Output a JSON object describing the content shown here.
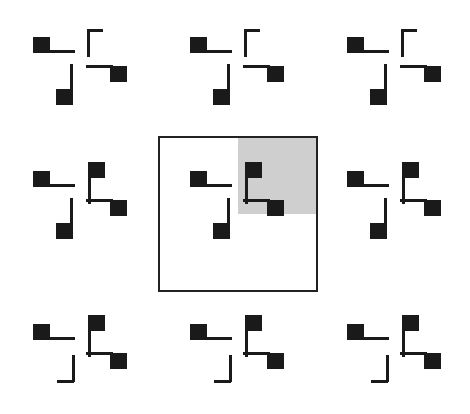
{
  "figure": {
    "grid": {
      "rows": 3,
      "cols": 3
    },
    "colors": {
      "element": "#1a1a1a",
      "highlight": "#cfcfcf",
      "frame": "#222222",
      "background": "#ffffff"
    },
    "highlighted_cell": {
      "row": 1,
      "col": 1,
      "highlighted_quadrant": "top-right"
    },
    "rows": [
      {
        "top_right": "corner",
        "bottom_left": "square"
      },
      {
        "top_right": "square",
        "bottom_left": "square"
      },
      {
        "top_right": "square",
        "bottom_left": "corner"
      }
    ],
    "constant_elements": {
      "top_left": "square-with-line-right",
      "bottom_right": "square-with-line-left"
    }
  }
}
